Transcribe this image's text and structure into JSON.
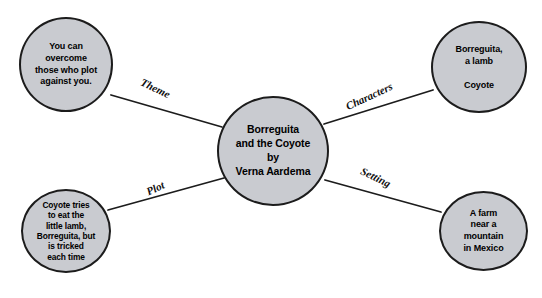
{
  "diagram": {
    "type": "concept-web",
    "title_node": {
      "id": "center",
      "text": "Borreguita\nand the Coyote\nby\nVerna Aardema"
    },
    "nodes": [
      {
        "id": "theme",
        "label": "Theme",
        "text": "You can\novercome\nthose who plot\nagainst you."
      },
      {
        "id": "characters",
        "label": "Characters",
        "text": "Borreguita,\na lamb\n\nCoyote"
      },
      {
        "id": "plot",
        "label": "Plot",
        "text": "Coyote tries\nto eat the\nlittle lamb,\nBorreguita, but\nis tricked\neach time"
      },
      {
        "id": "setting",
        "label": "Setting",
        "text": "A farm\nnear a\nmountain\nin Mexico"
      }
    ],
    "edges": [
      {
        "label": "Theme",
        "from": "center",
        "to": "theme"
      },
      {
        "label": "Characters",
        "from": "center",
        "to": "characters"
      },
      {
        "label": "Plot",
        "from": "center",
        "to": "plot"
      },
      {
        "label": "Setting",
        "from": "center",
        "to": "setting"
      }
    ],
    "colors": {
      "node_fill": "#c9cbd0",
      "node_stroke": "#1c1c1c",
      "edge_stroke": "#1c1c1c",
      "text": "#000000",
      "background": "#ffffff"
    }
  }
}
